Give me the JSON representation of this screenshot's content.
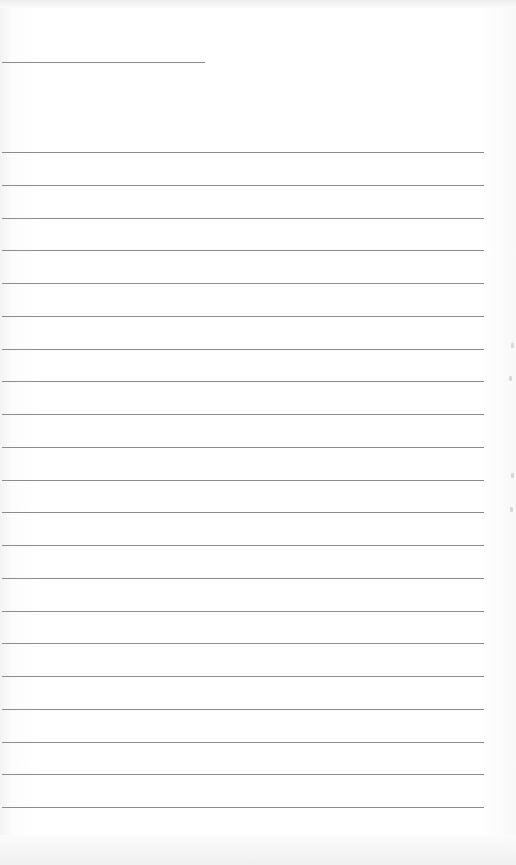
{
  "page": {
    "type": "lined-paper",
    "title_line": {
      "x": 2,
      "y": 62,
      "width": 203
    },
    "rules": {
      "count": 21,
      "first_y": 152,
      "spacing": 32.75,
      "x": 2,
      "width": 482
    },
    "line_color": "#8c8c8c",
    "background_color": "#ffffff",
    "edge_marks": [
      {
        "x": 511,
        "y": 343
      },
      {
        "x": 509,
        "y": 376
      },
      {
        "x": 511,
        "y": 473
      },
      {
        "x": 510,
        "y": 507
      }
    ]
  }
}
